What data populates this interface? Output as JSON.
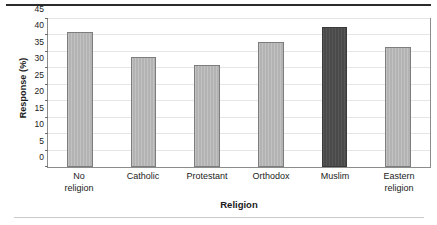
{
  "chart_data": {
    "type": "bar",
    "title": "",
    "subtitle": "",
    "xlabel": "Religion",
    "ylabel": "Response (%)",
    "categories": [
      "No religion",
      "Catholic",
      "Protestant",
      "Orthodox",
      "Muslim",
      "Eastern religion"
    ],
    "category_lines": [
      [
        "No",
        "religion"
      ],
      [
        "Catholic"
      ],
      [
        "Protestant"
      ],
      [
        "Orthodox"
      ],
      [
        "Muslim"
      ],
      [
        "Eastern",
        "religion"
      ]
    ],
    "values": [
      41.0,
      33.5,
      31.0,
      38.0,
      42.5,
      36.5
    ],
    "ylim": [
      0,
      45
    ],
    "yticks": [
      0,
      5,
      10,
      15,
      20,
      25,
      30,
      35,
      40,
      45
    ],
    "ytick_labels": [
      "0",
      "5",
      "10",
      "15",
      "20",
      "25",
      "30",
      "35",
      "40",
      "45"
    ],
    "grid": true,
    "legend": false,
    "legend_position": "none",
    "bar_colors": [
      "#b3b3b3",
      "#b3b3b3",
      "#b3b3b3",
      "#b3b3b3",
      "#4a4a4a",
      "#b3b3b3"
    ],
    "highlighted_category": "Muslim"
  },
  "style": {
    "bar_fill": "#b3b3b3",
    "bar_fill_highlight": "#4a4a4a",
    "bar_edge": "#7d7d7d",
    "bar_edge_highlight": "#3a3a3a",
    "grid_color": "#e6e6e6",
    "frame_color": "#8c8c8c",
    "text_color": "#1b1b1b",
    "rule_top_color": "#2b2b2b",
    "rule_bottom_color": "#c9c9c9",
    "background": "#ffffff"
  }
}
